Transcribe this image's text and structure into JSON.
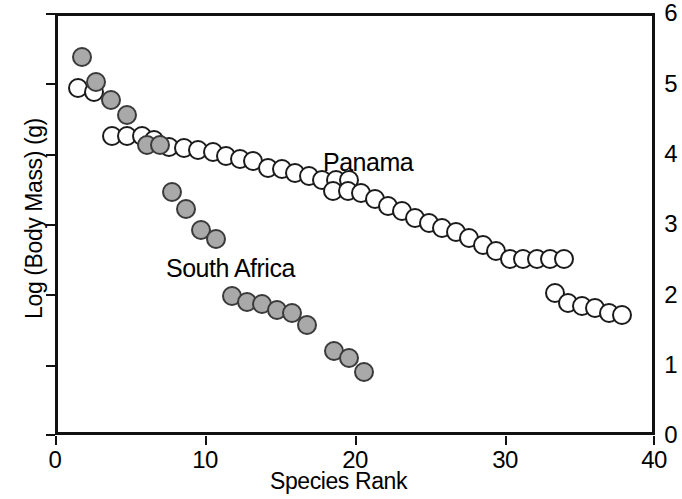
{
  "chart_data": {
    "type": "scatter",
    "title": "",
    "xlabel": "Species Rank",
    "ylabel": "Log (Body Mass) (g)",
    "xlim": [
      0,
      40
    ],
    "ylim": [
      0,
      6
    ],
    "xticks": [
      0,
      10,
      20,
      30,
      40
    ],
    "yticks": [
      0,
      1,
      2,
      3,
      4,
      5,
      6
    ],
    "grid": false,
    "legend_position": "in-plot annotations",
    "annotations": [
      {
        "text": "Panama",
        "x": 18.0,
        "y": 3.85
      },
      {
        "text": "South Africa",
        "x": 7.5,
        "y": 2.35
      }
    ],
    "series": [
      {
        "name": "Panama",
        "marker": "open circle",
        "color": "#ffffff",
        "edge_color": "#1b1b1b",
        "points": [
          [
            1.5,
            4.93
          ],
          [
            2.6,
            4.87
          ],
          [
            3.8,
            4.25
          ],
          [
            4.8,
            4.25
          ],
          [
            5.8,
            4.25
          ],
          [
            6.6,
            4.2
          ],
          [
            7.6,
            4.1
          ],
          [
            8.6,
            4.08
          ],
          [
            9.5,
            4.05
          ],
          [
            10.5,
            4.02
          ],
          [
            11.4,
            3.97
          ],
          [
            12.3,
            3.93
          ],
          [
            13.2,
            3.9
          ],
          [
            14.2,
            3.8
          ],
          [
            15.1,
            3.78
          ],
          [
            16.0,
            3.72
          ],
          [
            16.9,
            3.68
          ],
          [
            17.8,
            3.62
          ],
          [
            18.7,
            3.62
          ],
          [
            19.6,
            3.62
          ],
          [
            18.5,
            3.47
          ],
          [
            19.5,
            3.47
          ],
          [
            20.4,
            3.44
          ],
          [
            21.3,
            3.36
          ],
          [
            22.2,
            3.26
          ],
          [
            23.1,
            3.18
          ],
          [
            24.0,
            3.08
          ],
          [
            24.9,
            3.02
          ],
          [
            25.8,
            2.95
          ],
          [
            26.7,
            2.88
          ],
          [
            27.6,
            2.8
          ],
          [
            28.5,
            2.7
          ],
          [
            29.4,
            2.62
          ],
          [
            30.3,
            2.5
          ],
          [
            31.2,
            2.5
          ],
          [
            32.1,
            2.5
          ],
          [
            33.0,
            2.5
          ],
          [
            33.9,
            2.5
          ],
          [
            33.3,
            2.02
          ],
          [
            34.2,
            1.88
          ],
          [
            35.1,
            1.84
          ],
          [
            36.0,
            1.8
          ],
          [
            36.9,
            1.73
          ],
          [
            37.8,
            1.71
          ]
        ]
      },
      {
        "name": "South Africa",
        "marker": "filled circle",
        "color": "#a9a9a9",
        "edge_color": "#3a3a3a",
        "points": [
          [
            1.8,
            5.37
          ],
          [
            2.7,
            5.02
          ],
          [
            3.7,
            4.77
          ],
          [
            4.8,
            4.55
          ],
          [
            6.1,
            4.13
          ],
          [
            7.0,
            4.12
          ],
          [
            7.8,
            3.45
          ],
          [
            8.7,
            3.22
          ],
          [
            9.7,
            2.92
          ],
          [
            10.7,
            2.78
          ],
          [
            11.8,
            1.97
          ],
          [
            12.8,
            1.89
          ],
          [
            13.8,
            1.86
          ],
          [
            14.8,
            1.78
          ],
          [
            15.8,
            1.74
          ],
          [
            16.8,
            1.56
          ],
          [
            18.6,
            1.2
          ],
          [
            19.6,
            1.1
          ],
          [
            20.6,
            0.89
          ]
        ]
      }
    ]
  },
  "axis": {
    "y_title": "Log (Body Mass) (g)",
    "x_title": "Species Rank",
    "y_ticks": [
      "6",
      "5",
      "4",
      "3",
      "2",
      "1",
      "0"
    ],
    "x_ticks": [
      "0",
      "10",
      "20",
      "30",
      "40"
    ]
  },
  "labels": {
    "panama": "Panama",
    "south_africa": "South Africa"
  }
}
